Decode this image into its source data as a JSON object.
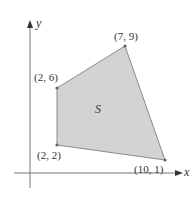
{
  "diagram": {
    "axes": {
      "x_label": "x",
      "y_label": "y"
    },
    "region": {
      "label": "S",
      "fill": "#d3d3d3",
      "stroke": "#8a8a8a"
    },
    "vertices": [
      {
        "coord": "(2, 6)",
        "x": 2,
        "y": 6
      },
      {
        "coord": "(7, 9)",
        "x": 7,
        "y": 9
      },
      {
        "coord": "(10, 1)",
        "x": 10,
        "y": 1
      },
      {
        "coord": "(2, 2)",
        "x": 2,
        "y": 2
      }
    ]
  }
}
